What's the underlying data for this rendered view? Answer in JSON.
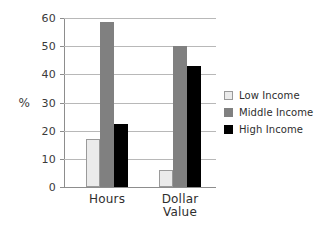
{
  "chart_data": {
    "type": "bar",
    "title": "",
    "xlabel": "",
    "ylabel": "%",
    "ylim": [
      0,
      60
    ],
    "yticks": [
      0,
      10,
      20,
      30,
      40,
      50,
      60
    ],
    "ytick_labels": [
      "0",
      "10",
      "20",
      "30",
      "40",
      "50",
      "60"
    ],
    "grid": true,
    "legend_position": "right",
    "categories": [
      "Hours",
      "Dollar Value"
    ],
    "category_lines": [
      [
        "Hours"
      ],
      [
        "Dollar",
        "Value"
      ]
    ],
    "series": [
      {
        "name": "Low Income",
        "color": "#ebebeb",
        "border_color": "#9a9a9a",
        "values": [
          17,
          6
        ]
      },
      {
        "name": "Middle Income",
        "color": "#808080",
        "border_color": "#808080",
        "values": [
          58.5,
          50
        ]
      },
      {
        "name": "High Income",
        "color": "#000000",
        "border_color": "#000000",
        "values": [
          22.5,
          43
        ]
      }
    ]
  },
  "axis": {
    "y_title": "%",
    "y_title_at_value": 30
  },
  "legend": {
    "entries": [
      {
        "label": "Low Income",
        "swatch": "low-income-swatch"
      },
      {
        "label": "Middle Income",
        "swatch": "middle-income-swatch"
      },
      {
        "label": "High Income",
        "swatch": "high-income-swatch"
      }
    ]
  }
}
